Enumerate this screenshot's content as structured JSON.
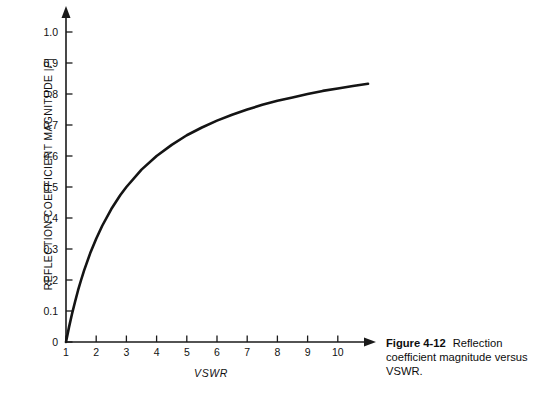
{
  "figure": {
    "caption_number": "Figure 4-12",
    "caption_text": "Reflection coefficient magnitude versus VSWR."
  },
  "axis_label_y_prefix": "REFLECTION COEFFICIENT MAGNITUDE |",
  "axis_label_y_symbol": "P",
  "axis_label_y_suffix": "|",
  "chart_data": {
    "type": "line",
    "title": "",
    "subtitle": "",
    "xlabel": "VSWR",
    "ylabel": "REFLECTION COEFFICIENT MAGNITUDE |P|",
    "xlim": [
      1,
      11
    ],
    "ylim": [
      0,
      1.05
    ],
    "grid": false,
    "legend": null,
    "annotations": [],
    "xticks": [
      1,
      2,
      3,
      4,
      5,
      6,
      7,
      8,
      9,
      10
    ],
    "xtick_labels": [
      "1",
      "2",
      "3",
      "4",
      "5",
      "6",
      "7",
      "8",
      "9",
      "10"
    ],
    "yticks": [
      0,
      0.1,
      0.2,
      0.3,
      0.4,
      0.5,
      0.6,
      0.7,
      0.8,
      0.9,
      1.0
    ],
    "ytick_labels": [
      "0",
      "0.1",
      "0.2",
      "0.3",
      "0.4",
      "0.5",
      "0.6",
      "0.7",
      "0.8",
      "0.9",
      "1.0"
    ],
    "series": [
      {
        "name": "Reflection coefficient magnitude",
        "formula": "(VSWR - 1) / (VSWR + 1)",
        "x": [
          1.0,
          1.1,
          1.2,
          1.3,
          1.4,
          1.5,
          1.6,
          1.8,
          2.0,
          2.2,
          2.5,
          2.8,
          3.0,
          3.5,
          4.0,
          4.5,
          5.0,
          5.5,
          6.0,
          6.5,
          7.0,
          7.5,
          8.0,
          8.5,
          9.0,
          9.5,
          10.0,
          10.5,
          11.0
        ],
        "y": [
          0.0,
          0.048,
          0.091,
          0.13,
          0.167,
          0.2,
          0.231,
          0.286,
          0.333,
          0.375,
          0.429,
          0.474,
          0.5,
          0.556,
          0.6,
          0.636,
          0.667,
          0.692,
          0.714,
          0.733,
          0.75,
          0.765,
          0.778,
          0.789,
          0.8,
          0.81,
          0.818,
          0.826,
          0.833
        ]
      }
    ]
  }
}
